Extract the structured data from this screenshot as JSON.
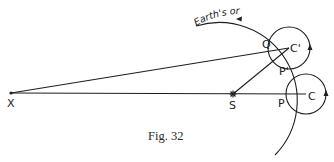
{
  "figure": {
    "caption": "Fig. 32",
    "orbit_label": "Earth's orbit",
    "points": {
      "X": "X",
      "S": "S",
      "C": "C",
      "C_prime": "C'",
      "P": "P",
      "P_prime": "P'",
      "Q": "Q"
    },
    "colors": {
      "ink": "#1e1e1e",
      "background": "#ffffff"
    }
  }
}
